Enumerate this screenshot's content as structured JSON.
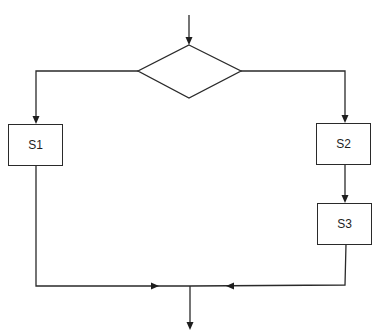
{
  "diagram": {
    "type": "flowchart",
    "decision": {
      "label": ""
    },
    "nodes": [
      {
        "id": "S1",
        "label": "S1",
        "branch": "left"
      },
      {
        "id": "S2",
        "label": "S2",
        "branch": "right"
      },
      {
        "id": "S3",
        "label": "S3",
        "branch": "right"
      }
    ],
    "edges": [
      {
        "from": "entry",
        "to": "decision"
      },
      {
        "from": "decision",
        "to": "S1"
      },
      {
        "from": "decision",
        "to": "S2"
      },
      {
        "from": "S2",
        "to": "S3"
      },
      {
        "from": "S1",
        "to": "merge"
      },
      {
        "from": "S3",
        "to": "merge"
      },
      {
        "from": "merge",
        "to": "exit"
      }
    ],
    "colors": {
      "line": "#2a2a2a",
      "background": "#ffffff"
    }
  }
}
